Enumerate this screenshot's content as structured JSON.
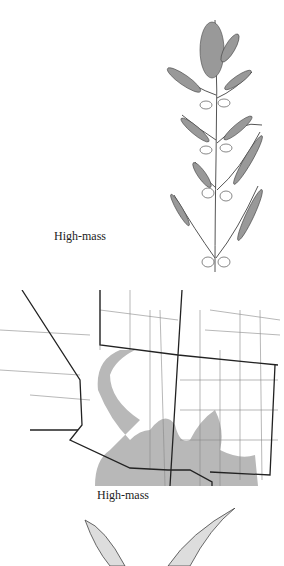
{
  "figures": {
    "plant_illustration": {
      "caption": "High-mass",
      "icon": "plant-inflorescence-drawing"
    },
    "range_map": {
      "caption": "High-mass",
      "icon": "range-map",
      "shade_color": "#b8b8b8",
      "line_color": "#222222"
    },
    "leaf_illustration": {
      "icon": "leaf-pair-drawing"
    }
  }
}
